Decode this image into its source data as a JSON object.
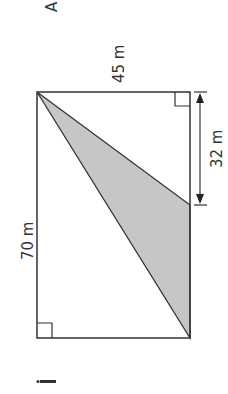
{
  "diagram": {
    "labels": {
      "top_width": "45 m",
      "left_height": "70 m",
      "right_segment": "32 m",
      "corner_letter": "A",
      "question_marker": "i"
    },
    "colors": {
      "shade": "#c8c8c8",
      "line": "#333333"
    }
  }
}
